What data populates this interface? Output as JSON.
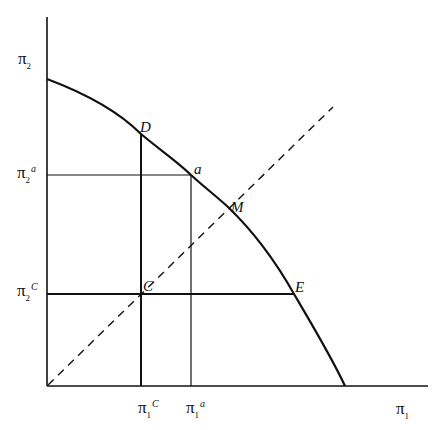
{
  "diagram": {
    "type": "utility-possibility-frontier",
    "colors": {
      "line": "#111111",
      "background": "#ffffff"
    },
    "axes": {
      "x": {
        "symbol": "π",
        "subscript": "1",
        "superscript": ""
      },
      "y": {
        "symbol": "π",
        "subscript": "2",
        "superscript": ""
      }
    },
    "ticks": {
      "x": [
        {
          "symbol": "π",
          "subscript": "1",
          "superscript": "C"
        },
        {
          "symbol": "π",
          "subscript": "1",
          "superscript": "a"
        }
      ],
      "y": [
        {
          "symbol": "π",
          "subscript": "2",
          "superscript": "a"
        },
        {
          "symbol": "π",
          "subscript": "2",
          "superscript": "C"
        }
      ]
    },
    "points": {
      "D": "D",
      "a": "a",
      "M": "M",
      "C": "C",
      "E": "E"
    },
    "lines": {
      "frontier": "solid curve from π2-axis intercept through D, a, M, E to π1-axis intercept",
      "diagonal": "dashed 45° line from origin through C and M",
      "guides": [
        "vertical at π1^C (C to D)",
        "vertical at π1^a (to a)",
        "horizontal at π2^a (to a)",
        "horizontal at π2^C (C to E)"
      ]
    }
  }
}
